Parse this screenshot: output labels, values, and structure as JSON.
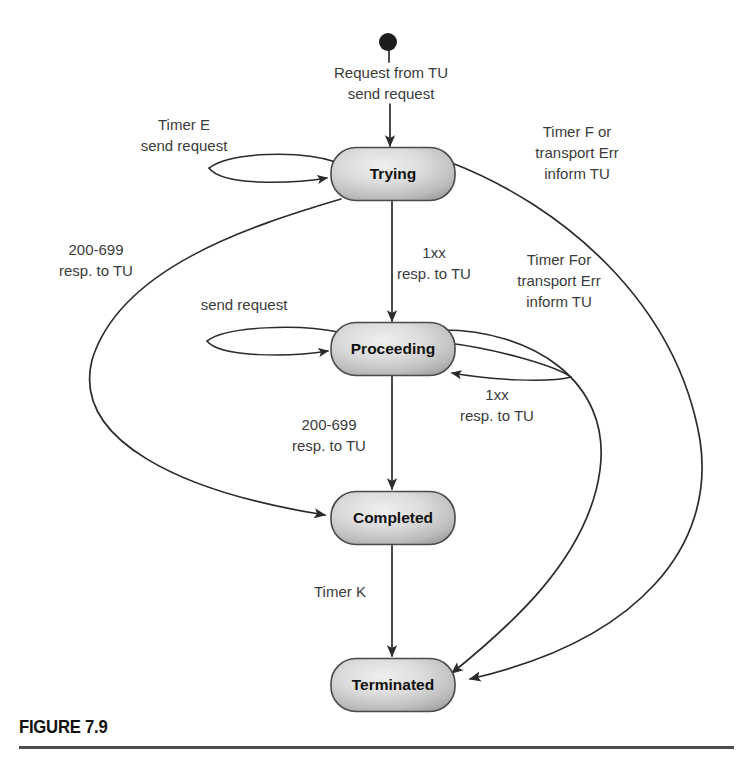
{
  "figure": {
    "caption": "FIGURE 7.9"
  },
  "colors": {
    "state_fill_light": "#e8e8e8",
    "state_fill_mid": "#c2c2c2",
    "state_fill_dark": "#9a9a9a",
    "state_border": "#4a4a4a",
    "line": "#2b2b2b",
    "label_text": "#3b3b3b",
    "state_text": "#111111",
    "caption_text": "#111111",
    "caption_rule": "#4d4d4d",
    "start_dot": "#1d1d1d",
    "background": "#ffffff"
  },
  "start_state": {
    "name": "initial-state-dot",
    "cx": 388,
    "cy": 42,
    "r": 9
  },
  "states": [
    {
      "id": "trying",
      "label": "Trying",
      "cx": 393,
      "cy": 174,
      "w": 124,
      "h": 53
    },
    {
      "id": "proceeding",
      "label": "Proceeding",
      "cx": 393,
      "cy": 349,
      "w": 124,
      "h": 53
    },
    {
      "id": "completed",
      "label": "Completed",
      "cx": 393,
      "cy": 518,
      "w": 124,
      "h": 53
    },
    {
      "id": "terminated",
      "label": "Terminated",
      "cx": 393,
      "cy": 685,
      "w": 124,
      "h": 53
    }
  ],
  "transitions": [
    {
      "id": "start-to-trying",
      "from": "initial",
      "to": "trying",
      "label_lines": [
        "Request from TU",
        "send request"
      ],
      "label_x": 391,
      "label_y": 78
    },
    {
      "id": "trying-self-loop",
      "from": "trying",
      "to": "trying",
      "label_lines": [
        "Timer E",
        "send request"
      ],
      "label_x": 184,
      "label_y": 130
    },
    {
      "id": "trying-to-terminated-timerf",
      "from": "trying",
      "to": "terminated",
      "label_lines": [
        "Timer F or",
        "transport Err",
        "inform TU"
      ],
      "label_x": 577,
      "label_y": 137
    },
    {
      "id": "trying-to-completed",
      "from": "trying",
      "to": "completed",
      "label_lines": [
        "200-699",
        "resp. to TU"
      ],
      "label_x": 96,
      "label_y": 255
    },
    {
      "id": "trying-to-proceeding",
      "from": "trying",
      "to": "proceeding",
      "label_lines": [
        "1xx",
        "resp. to TU"
      ],
      "label_x": 392,
      "label_y": 258
    },
    {
      "id": "proceeding-to-terminated-timerf",
      "from": "proceeding",
      "to": "terminated",
      "label_lines": [
        "Timer For",
        "transport Err",
        "inform TU"
      ],
      "label_x": 559,
      "label_y": 265
    },
    {
      "id": "proceeding-self-loop-send",
      "from": "proceeding",
      "to": "proceeding",
      "label_lines": [
        "send request"
      ],
      "label_x": 244,
      "label_y": 310
    },
    {
      "id": "proceeding-self-loop-1xx",
      "from": "proceeding",
      "to": "proceeding",
      "label_lines": [
        "1xx",
        "resp. to TU"
      ],
      "label_x": 506,
      "label_y": 397
    },
    {
      "id": "proceeding-to-completed",
      "from": "proceeding",
      "to": "completed",
      "label_lines": [
        "200-699",
        "resp. to TU"
      ],
      "label_x": 329,
      "label_y": 425
    },
    {
      "id": "completed-to-terminated",
      "from": "completed",
      "to": "terminated",
      "label_lines": [
        "Timer K"
      ],
      "label_x": 340,
      "label_y": 597
    }
  ],
  "diagram_meta": {
    "type": "state-machine-diagram",
    "state_count": 4,
    "transition_count": 10,
    "self_loop_count": 3
  }
}
